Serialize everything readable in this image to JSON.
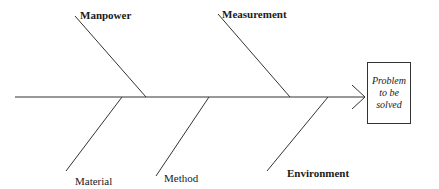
{
  "diagram": {
    "type": "fishbone",
    "effect": {
      "lines": [
        "Problem",
        "to be",
        "solved"
      ]
    },
    "causes_top": [
      {
        "label": "Manpower"
      },
      {
        "label": "Measurement"
      }
    ],
    "causes_bottom": [
      {
        "label": "Material"
      },
      {
        "label": "Method"
      },
      {
        "label": "Environment"
      }
    ],
    "line_color": "#333333"
  }
}
